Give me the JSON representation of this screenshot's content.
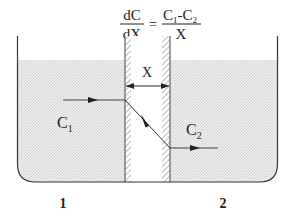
{
  "equation": {
    "lhs_numerator": "dC",
    "lhs_denominator": "dX",
    "equals": "=",
    "rhs_numerator_c1": "C",
    "rhs_numerator_sub1": "1",
    "rhs_numerator_minus": "-C",
    "rhs_numerator_sub2": "2",
    "rhs_denominator": "X"
  },
  "labels": {
    "thickness": "X",
    "concentration_left": "C",
    "concentration_left_sub": "1",
    "concentration_right": "C",
    "concentration_right_sub": "2",
    "compartment_left": "1",
    "compartment_right": "2"
  },
  "colors": {
    "line": "#333333",
    "fluid_fill": "#e6e6e6",
    "hatch": "#666666",
    "background": "#ffffff"
  }
}
